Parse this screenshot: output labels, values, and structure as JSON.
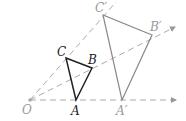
{
  "diagram": {
    "type": "homothety",
    "center": {
      "label": "O",
      "x": 30,
      "y": 100
    },
    "original_triangle": {
      "color": "#222222",
      "vertices": [
        {
          "label": "A",
          "x": 76,
          "y": 100
        },
        {
          "label": "B",
          "x": 92,
          "y": 68
        },
        {
          "label": "C",
          "x": 66,
          "y": 58
        }
      ]
    },
    "image_triangle": {
      "color": "#888888",
      "vertices": [
        {
          "label": "A′",
          "x": 122,
          "y": 100
        },
        {
          "label": "B′",
          "x": 152,
          "y": 35
        },
        {
          "label": "C′",
          "x": 103,
          "y": 15
        }
      ]
    },
    "rays": [
      {
        "through": "A",
        "end_x": 176,
        "end_y": 100
      },
      {
        "through": "B",
        "end_x": 175,
        "end_y": 27
      },
      {
        "through": "C",
        "end_x": 116,
        "end_y": 2
      }
    ],
    "labels": {
      "O": "O",
      "A": "A",
      "B": "B",
      "C": "C",
      "A_prime": "A′",
      "B_prime": "B′",
      "C_prime": "C′"
    }
  }
}
